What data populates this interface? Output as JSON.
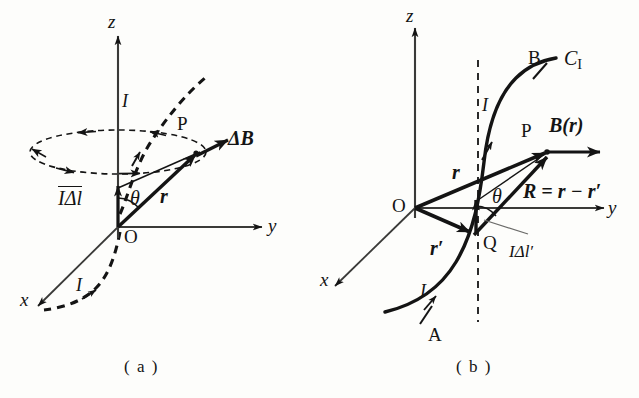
{
  "figure": {
    "background_color": "#fdfdfb",
    "ink_color": "#141414"
  },
  "panels": [
    {
      "id": "a",
      "caption": "( a )",
      "axes": {
        "x": "x",
        "y": "y",
        "z": "z"
      },
      "origin_label": "O",
      "points": [
        {
          "name": "P",
          "label": "P"
        }
      ],
      "vectors": [
        {
          "name": "current-element",
          "label": "IΔl",
          "bold": false,
          "overline": true
        },
        {
          "name": "position-vector",
          "label": "r",
          "bold": true
        },
        {
          "name": "field-increment",
          "label": "ΔB",
          "bold": true
        }
      ],
      "angles": [
        {
          "name": "theta",
          "label": "θ"
        }
      ],
      "current_labels": [
        {
          "name": "current-upper",
          "label": "I"
        },
        {
          "name": "current-lower",
          "label": "I"
        }
      ],
      "field_lines": {
        "style": "dashed-ellipse",
        "count": 1
      },
      "wire": {
        "style": "dashed",
        "description": "current-carrying wire through origin"
      }
    },
    {
      "id": "b",
      "caption": "( b )",
      "axes": {
        "x": "x",
        "y": "y",
        "z": "z"
      },
      "origin_label": "O",
      "points": [
        {
          "name": "P",
          "label": "P"
        },
        {
          "name": "Q",
          "label": "Q"
        },
        {
          "name": "A",
          "label": "A"
        },
        {
          "name": "B",
          "label": "B"
        }
      ],
      "curve_label": {
        "base": "C",
        "subscript": "I"
      },
      "vectors": [
        {
          "name": "position-vector-r",
          "label": "r",
          "bold": true
        },
        {
          "name": "source-vector-r-prime",
          "label": "r′",
          "bold": true
        },
        {
          "name": "separation-vector",
          "label": "R = r − r′",
          "bold": true
        },
        {
          "name": "field-vector",
          "label": "B(r)",
          "bold": true
        },
        {
          "name": "current-element",
          "label": "IΔl′",
          "bold": false
        }
      ],
      "angles": [
        {
          "name": "theta",
          "label": "θ"
        }
      ],
      "current_labels": [
        {
          "name": "current-upper",
          "label": "I"
        },
        {
          "name": "current-lower",
          "label": "I"
        }
      ],
      "guide_line": {
        "style": "dashed-vertical"
      },
      "wire": {
        "style": "solid",
        "description": "current-carrying wire C_I from A to B"
      }
    }
  ]
}
